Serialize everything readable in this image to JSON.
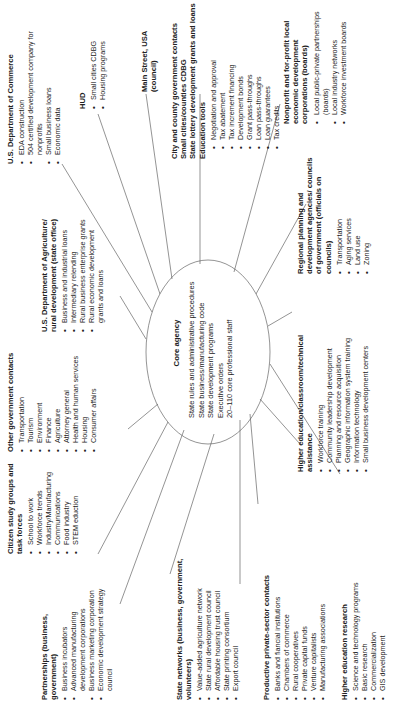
{
  "diagram": {
    "core": {
      "title": "Core agency",
      "lines": [
        "State rules and administrative procedures",
        "State business/manufacturing code",
        "State development programs",
        "Executive orders",
        "20–110 core professional staff"
      ]
    },
    "nodes": {
      "citizen": {
        "title": "Citizen study groups and task forces",
        "items": [
          "School to work",
          "Workforce trends",
          "Industry/Manufacturing",
          "Communications",
          "Food industry",
          "STEM eduction"
        ]
      },
      "other_gov": {
        "title": "Other government contacts",
        "items": [
          "Transportation",
          "Tourism",
          "Environment",
          "Finance",
          "Agriculture",
          "Attorney general",
          "Health and human services",
          "Housing",
          "Consumer affairs"
        ]
      },
      "usda": {
        "title": "U.S. Department of Agriculture/ rural development (state office)",
        "items": [
          "Business and industrial loans",
          "Intermediary relending",
          "Rural business enterprise grants",
          "Rural economic development grants and loans"
        ]
      },
      "commerce": {
        "title": "U.S. Department of Commerce",
        "items": [
          "EDA construction",
          "504 certified development company for nonprofits",
          "Small business loans",
          "Economic data"
        ]
      },
      "hud": {
        "title": "HUD",
        "items": [
          "Small cities CDBG",
          "Housing programs"
        ]
      },
      "main_street": {
        "title": "Main Street, USA (council)"
      },
      "city_county": {
        "title_lines": [
          "City and county government contacts",
          "Small cities/counties CDBG",
          "State lottery development grants and loans",
          "Education tools"
        ],
        "items": [
          "Negotiation and approval",
          "Tax abatement",
          "Tax increment financing",
          "Development bonds",
          "Grant pass-throughs",
          "Loan pass-throughs",
          "Loan guarantees",
          "Tax credits"
        ]
      },
      "nonprofit": {
        "title": "Nonprofit and for-profit local economic development corporations (boards)",
        "items": [
          "Local public-private partnerships (boards)",
          "Local industry networks",
          "Workforce investment boards"
        ]
      },
      "partnerships": {
        "title": "Partnerships (business, government)",
        "items": [
          "Business incubators",
          "Advanced manufacturing development corporations",
          "Business marketing corporation",
          "Economic development strategy council"
        ]
      },
      "state_networks": {
        "title": "State networks (business, government, volunteers)",
        "items": [
          "Value-added agriculture network",
          "State rural development council",
          "Affordable housing trust council",
          "State printing consortium",
          "Export council"
        ]
      },
      "private_sector": {
        "title": "Productive private-sector contacts",
        "items": [
          "Banks and fiancial institutions",
          "Chambers of commerce",
          "Rural cooperatives",
          "Private capital funds",
          "Venture capitalists",
          "Manufacturing associations"
        ]
      },
      "higher_ed_research": {
        "title": "Higher education research",
        "items": [
          "Science and technology programs",
          "Basic research",
          "Commercialization",
          "GIS development"
        ]
      },
      "higher_ed_classroom": {
        "title": "Higher education/classroom/technical assistance",
        "items": [
          "Workforce training",
          "Community leadership development",
          "Planning and resource acquisition",
          "Geographic information system training",
          "Information technology",
          "Small business development centers"
        ]
      },
      "regional": {
        "title": "Regional planning and development agencies/ councils of government (officials on councils)",
        "items": [
          "Transportation",
          "Aging services",
          "Land use",
          "Zoning"
        ]
      }
    },
    "colors": {
      "line": "#555555",
      "text": "#222222",
      "background": "#ffffff"
    }
  }
}
